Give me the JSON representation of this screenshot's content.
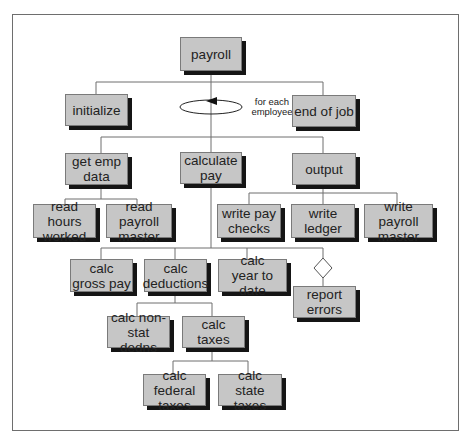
{
  "diagram": {
    "colors": {
      "box_fill": "#c6c6c6",
      "box_border": "#7a7a7a",
      "shadow": "#151515",
      "line": "#6e6e6e",
      "frame": "#6e6e6e"
    },
    "loop": {
      "label": "for each\nemployee"
    },
    "nodes": {
      "payroll": "payroll",
      "initialize": "initialize",
      "end_of_job": "end of job",
      "get_emp_data": "get  emp\ndata",
      "calculate_pay": "calculate\npay",
      "output": "output",
      "read_hours_worked": "read hours\nworked",
      "read_payroll_master": "read payroll\nmaster",
      "write_pay_checks": "write pay\nchecks",
      "write_ledger": "write\nledger",
      "write_payroll_master": "write payroll\nmaster",
      "calc_gross_pay": "calc\ngross pay",
      "calc_deductions": "calc\ndeductions",
      "calc_year_to_date": "calc\nyear to date",
      "report_errors": "report\nerrors",
      "calc_non_stat_dedns": "calc non-\nstat dedns",
      "calc_taxes": "calc\ntaxes",
      "calc_federal_taxes": "calc federal\ntaxes",
      "calc_state_taxes": "calc\nstate taxes"
    },
    "edges": [
      [
        "payroll",
        "initialize"
      ],
      [
        "payroll",
        "end_of_job"
      ],
      [
        "payroll",
        "get_emp_data"
      ],
      [
        "payroll",
        "calculate_pay"
      ],
      [
        "payroll",
        "output"
      ],
      [
        "get_emp_data",
        "read_hours_worked"
      ],
      [
        "get_emp_data",
        "read_payroll_master"
      ],
      [
        "output",
        "write_pay_checks"
      ],
      [
        "output",
        "write_ledger"
      ],
      [
        "output",
        "write_payroll_master"
      ],
      [
        "calculate_pay",
        "calc_gross_pay"
      ],
      [
        "calculate_pay",
        "calc_deductions"
      ],
      [
        "calculate_pay",
        "calc_year_to_date"
      ],
      [
        "calculate_pay",
        "report_errors"
      ],
      [
        "calc_deductions",
        "calc_non_stat_dedns"
      ],
      [
        "calc_deductions",
        "calc_taxes"
      ],
      [
        "calc_taxes",
        "calc_federal_taxes"
      ],
      [
        "calc_taxes",
        "calc_state_taxes"
      ]
    ],
    "conditional_edges": [
      [
        "calculate_pay",
        "report_errors"
      ]
    ]
  }
}
